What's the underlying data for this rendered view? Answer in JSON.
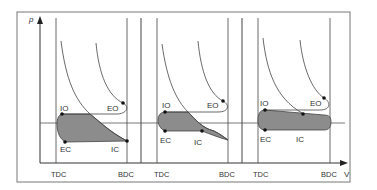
{
  "diagram": {
    "axes": {
      "y_label": "p",
      "x_label": "V"
    },
    "colors": {
      "line": "#444444",
      "fill": "#8c8c8c",
      "frame": "#777777",
      "text": "#333333"
    },
    "panels": [
      {
        "tdc_label": "TDC",
        "bdc_label": "BDC",
        "io": "IO",
        "eo": "EO",
        "ec": "EC",
        "ic": "IC"
      },
      {
        "tdc_label": "TDC",
        "bdc_label": "BDC",
        "io": "IO",
        "eo": "EO",
        "ec": "EC",
        "ic": "IC"
      },
      {
        "tdc_label": "TDC",
        "bdc_label": "BDC",
        "io": "IO",
        "eo": "EO",
        "ec": "EC",
        "ic": "IC"
      }
    ]
  }
}
